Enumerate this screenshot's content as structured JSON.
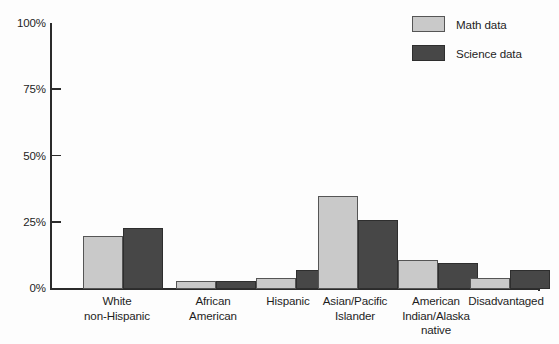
{
  "chart_data": {
    "type": "bar",
    "title": "",
    "xlabel": "",
    "ylabel": "",
    "ylim": [
      0,
      100
    ],
    "yticks": [
      0,
      25,
      50,
      75,
      100
    ],
    "ytick_labels": [
      "0%",
      "25%",
      "50%",
      "75%",
      "100%"
    ],
    "grid": false,
    "legend_position": "top-right",
    "categories": [
      "White\nnon-Hispanic",
      "African\nAmerican",
      "Hispanic",
      "Asian/Pacific\nIslander",
      "American\nIndian/Alaska\nnative",
      "Disadvantaged"
    ],
    "category_lines": [
      [
        "White",
        "non-Hispanic"
      ],
      [
        "African",
        "American"
      ],
      [
        "Hispanic"
      ],
      [
        "Asian/Pacific",
        "Islander"
      ],
      [
        "American",
        "Indian/Alaska",
        "native"
      ],
      [
        "Disadvantaged"
      ]
    ],
    "series": [
      {
        "name": "Math data",
        "color": "#c9c9c9",
        "values": [
          20,
          3,
          4,
          35,
          11,
          4
        ]
      },
      {
        "name": "Science data",
        "color": "#474747",
        "values": [
          23,
          3,
          7,
          26,
          10,
          7
        ]
      }
    ]
  },
  "legend": {
    "items": [
      {
        "label": "Math data",
        "key": "math"
      },
      {
        "label": "Science data",
        "key": "science"
      }
    ]
  },
  "axis": {
    "y_tick_labels": [
      "100%",
      "75%",
      "50%",
      "25%",
      "0%"
    ]
  }
}
